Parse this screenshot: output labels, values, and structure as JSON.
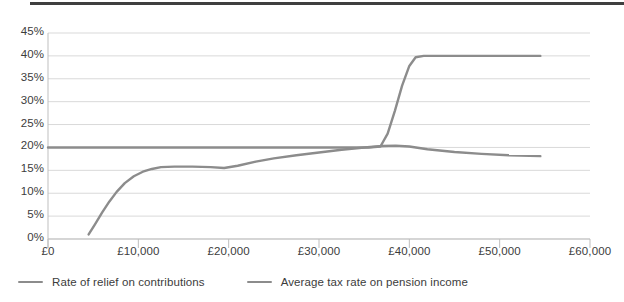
{
  "chart_data": {
    "type": "line",
    "title": "",
    "xlabel": "",
    "ylabel": "",
    "grid": true,
    "legend_position": "bottom-left",
    "xlim": [
      0,
      60000
    ],
    "ylim": [
      0,
      45
    ],
    "x_tick_labels": [
      "£0",
      "£10,000",
      "£20,000",
      "£30,000",
      "£40,000",
      "£50,000",
      "£60,000"
    ],
    "x_tick_values": [
      0,
      10000,
      20000,
      30000,
      40000,
      50000,
      60000
    ],
    "y_tick_labels": [
      "0%",
      "5%",
      "10%",
      "15%",
      "20%",
      "25%",
      "30%",
      "35%",
      "40%",
      "45%"
    ],
    "y_tick_values": [
      0,
      5,
      10,
      15,
      20,
      25,
      30,
      35,
      40,
      45
    ],
    "series": [
      {
        "name": "Rate of relief on contributions",
        "color": "#8c8c8c",
        "points": [
          [
            4500,
            1.0
          ],
          [
            5200,
            3.2
          ],
          [
            6000,
            5.8
          ],
          [
            6800,
            8.2
          ],
          [
            7600,
            10.3
          ],
          [
            8500,
            12.2
          ],
          [
            9500,
            13.7
          ],
          [
            10500,
            14.7
          ],
          [
            11500,
            15.3
          ],
          [
            12500,
            15.7
          ],
          [
            14000,
            15.8
          ],
          [
            16000,
            15.8
          ],
          [
            18000,
            15.7
          ],
          [
            19500,
            15.5
          ],
          [
            21000,
            16.0
          ],
          [
            23000,
            16.9
          ],
          [
            25000,
            17.6
          ],
          [
            27500,
            18.3
          ],
          [
            30000,
            18.9
          ],
          [
            32500,
            19.5
          ],
          [
            35000,
            20.0
          ],
          [
            37000,
            20.3
          ],
          [
            38500,
            20.4
          ],
          [
            40000,
            20.2
          ],
          [
            42000,
            19.6
          ],
          [
            45000,
            19.0
          ],
          [
            48000,
            18.6
          ],
          [
            51000,
            18.3
          ],
          [
            54500,
            18.1
          ]
        ]
      },
      {
        "name": "Average tax rate on pension income",
        "color": "#8c8c8c",
        "points": [
          [
            0,
            20.0
          ],
          [
            10000,
            20.0
          ],
          [
            20000,
            20.0
          ],
          [
            30000,
            20.0
          ],
          [
            35500,
            20.0
          ],
          [
            36800,
            20.2
          ],
          [
            37600,
            23.0
          ],
          [
            38400,
            28.0
          ],
          [
            39200,
            33.5
          ],
          [
            40000,
            37.8
          ],
          [
            40700,
            39.7
          ],
          [
            41600,
            40.0
          ],
          [
            45000,
            40.0
          ],
          [
            50000,
            40.0
          ],
          [
            54500,
            40.0
          ]
        ]
      }
    ],
    "legend": [
      {
        "label": "Rate of relief on contributions",
        "swatch": "line-swatch",
        "color": "#8c8c8c"
      },
      {
        "label": "Average tax rate on pension income",
        "swatch": "line-swatch",
        "color": "#8c8c8c"
      }
    ],
    "colors": {
      "grid": "#d9d9d9",
      "axis": "#bfbfbf",
      "text": "#3c3c3c",
      "top_rule": "#3f3f3f",
      "line": "#8c8c8c",
      "background": "#ffffff"
    }
  },
  "layout": {
    "plot_left": 48,
    "plot_right": 590,
    "plot_top": 33,
    "plot_bottom": 239
  }
}
